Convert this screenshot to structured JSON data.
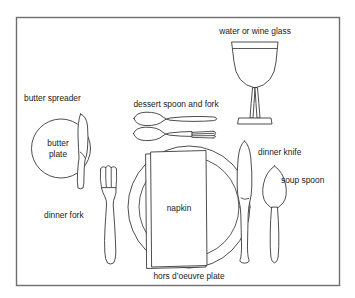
{
  "diagram": {
    "background_color": "#ffffff",
    "frame": {
      "stroke_color": "#6e6e6e",
      "fill_color": "#ffffff"
    },
    "line_color": "#3a3a3a",
    "text_color": "#1a1a1a",
    "labels": {
      "water_or_wine_glass": "water or wine glass",
      "butter_spreader": "butter spreader",
      "dessert_spoon_and_fork": "dessert spoon and fork",
      "butter_plate_line1": "butter",
      "butter_plate_line2": "plate",
      "dinner_knife": "dinner knife",
      "soup_spoon": "soup spoon",
      "napkin": "napkin",
      "dinner_fork": "dinner fork",
      "hors_doeuvre_plate": "hors d’oeuvre plate"
    },
    "items": [
      {
        "name": "water-or-wine-glass",
        "label": "water or wine glass"
      },
      {
        "name": "butter-spreader",
        "label": "butter spreader"
      },
      {
        "name": "butter-plate",
        "label": "butter plate"
      },
      {
        "name": "dessert-spoon-and-fork",
        "label": "dessert spoon and fork"
      },
      {
        "name": "dinner-knife",
        "label": "dinner knife"
      },
      {
        "name": "soup-spoon",
        "label": "soup spoon"
      },
      {
        "name": "napkin",
        "label": "napkin"
      },
      {
        "name": "dinner-fork",
        "label": "dinner fork"
      },
      {
        "name": "hors-doeuvre-plate",
        "label": "hors d’oeuvre plate"
      }
    ]
  }
}
